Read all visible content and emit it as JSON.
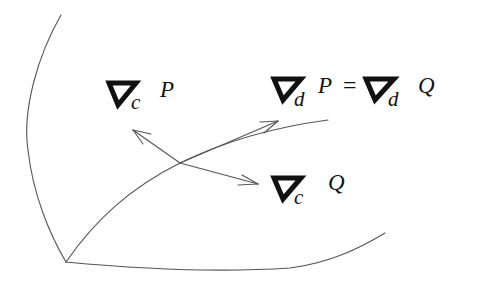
{
  "diagram": {
    "title": "",
    "colors": {
      "stroke": "#555555",
      "text": "#111111",
      "background": "#ffffff"
    },
    "labels": {
      "nabla_c_P": {
        "operator": "nabla-icon",
        "subscript": "c",
        "operand": "P"
      },
      "nabla_d_P_eq": {
        "left": {
          "operator": "nabla-icon",
          "subscript": "d",
          "operand": "P"
        },
        "equals": "=",
        "right": {
          "operator": "nabla-icon",
          "subscript": "d",
          "operand": "Q"
        }
      },
      "nabla_c_Q": {
        "operator": "nabla-icon",
        "subscript": "c",
        "operand": "Q"
      }
    },
    "curves": [
      {
        "name": "left-boundary-curve",
        "description": "curved edge from top down to corner"
      },
      {
        "name": "bottom-boundary-curve",
        "description": "curved edge from corner to right"
      },
      {
        "name": "diagonal-curve",
        "description": "curve from corner through base point"
      }
    ],
    "arrows": [
      {
        "name": "arrow-nabla-c-P",
        "target": "∇c P"
      },
      {
        "name": "arrow-nabla-d-P",
        "target": "∇d P = ∇d Q"
      },
      {
        "name": "arrow-nabla-c-Q",
        "target": "∇c Q"
      }
    ]
  }
}
